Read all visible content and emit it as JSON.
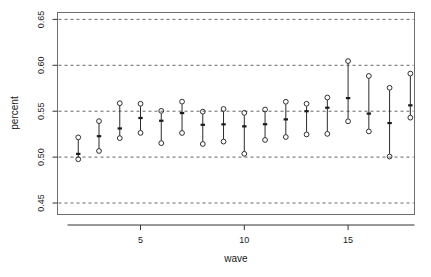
{
  "chart_data": {
    "type": "scatter",
    "title": "",
    "xlabel": "wave",
    "ylabel": "percent",
    "xlim": [
      1,
      18.2
    ],
    "ylim": [
      0.4375,
      0.6575
    ],
    "xticks": [
      5,
      10,
      15
    ],
    "xtick_labels": [
      "5",
      "10",
      "15"
    ],
    "yticks": [
      0.45,
      0.5,
      0.55,
      0.6,
      0.65
    ],
    "ytick_labels": [
      "0.45",
      "0.50",
      "0.55",
      "0.60",
      "0.65"
    ],
    "grid": "horizontal dashed at every y tick",
    "legend": "none",
    "marker": "open circle endpoints with filled tick at centre, joined by vertical segment",
    "series": [
      {
        "name": "percent interval by wave",
        "x": [
          2,
          3,
          4,
          5,
          6,
          7,
          8,
          9,
          10,
          11,
          12,
          13,
          14,
          15,
          16,
          17,
          18
        ],
        "lower": [
          0.4977,
          0.5067,
          0.5207,
          0.5264,
          0.5152,
          0.5263,
          0.5143,
          0.5169,
          0.5036,
          0.5187,
          0.5219,
          0.5247,
          0.5253,
          0.539,
          0.528,
          0.5006,
          0.543
        ],
        "center": [
          0.5035,
          0.5228,
          0.5312,
          0.5426,
          0.5396,
          0.548,
          0.5352,
          0.5357,
          0.5335,
          0.5358,
          0.5411,
          0.55,
          0.5538,
          0.5643,
          0.5474,
          0.5371,
          0.5564
        ],
        "upper": [
          0.5215,
          0.5392,
          0.5587,
          0.5581,
          0.5504,
          0.5604,
          0.5495,
          0.5524,
          0.5482,
          0.5518,
          0.5603,
          0.5581,
          0.5649,
          0.6046,
          0.5884,
          0.5755,
          0.591
        ]
      }
    ]
  },
  "axes": {
    "y_axis_label": "percent",
    "x_axis_label": "wave"
  }
}
